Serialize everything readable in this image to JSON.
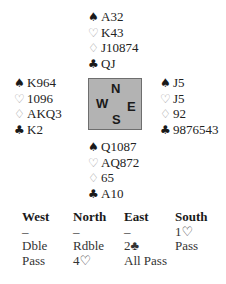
{
  "hands": {
    "north": {
      "spades": "A32",
      "hearts": "K43",
      "diamonds": "J10874",
      "clubs": "QJ"
    },
    "west": {
      "spades": "K964",
      "hearts": "1096",
      "diamonds": "AKQ3",
      "clubs": "K2"
    },
    "east": {
      "spades": "J5",
      "hearts": "J5",
      "diamonds": "92",
      "clubs": "9876543"
    },
    "south": {
      "spades": "Q1087",
      "hearts": "AQ872",
      "diamonds": "65",
      "clubs": "A10"
    }
  },
  "suit_symbols": {
    "spades": "♠",
    "hearts": "♡",
    "diamonds": "♢",
    "clubs": "♣"
  },
  "compass": {
    "n": "N",
    "s": "S",
    "w": "W",
    "e": "E",
    "fill_color": "#b3b3b3"
  },
  "bidding": {
    "headers": [
      "West",
      "North",
      "East",
      "South"
    ],
    "rows": [
      [
        "–",
        "–",
        "–",
        "1♡"
      ],
      [
        "Dble",
        "Rdble",
        "2♣",
        "Pass"
      ],
      [
        "Pass",
        "4♡",
        "All Pass",
        ""
      ]
    ]
  }
}
